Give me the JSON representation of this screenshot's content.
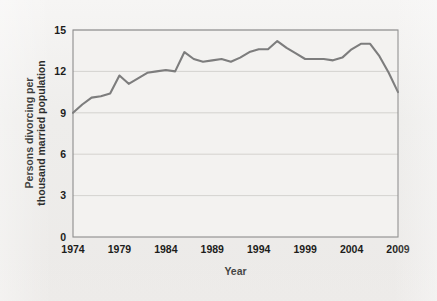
{
  "figure": {
    "background_color": "#efeeec",
    "plot_background_color": "#f2f1ef",
    "frame_color": "#8c8c8c",
    "grid_color": "#c9c8c5",
    "line_color": "#7d7d7d",
    "text_color": "#1d1d1b"
  },
  "chart_data": {
    "type": "line",
    "title": "",
    "subtitle": "",
    "xlabel": "Year",
    "ylabel": "Persons divorcing per thousand married population",
    "ylabel_line1": "Persons divorcing per",
    "ylabel_line2": "thousand married population",
    "xlim": [
      1974,
      2009
    ],
    "ylim": [
      0,
      15
    ],
    "xticks": [
      1974,
      1979,
      1984,
      1989,
      1994,
      1999,
      2004,
      2009
    ],
    "xtick_labels": [
      "1974",
      "1979",
      "1984",
      "1989",
      "1994",
      "1999",
      "2004",
      "2009"
    ],
    "yticks": [
      0,
      3,
      6,
      9,
      12,
      15
    ],
    "ytick_labels": [
      "0",
      "3",
      "6",
      "9",
      "12",
      "15"
    ],
    "grid": "horizontal",
    "legend": "none",
    "series": [
      {
        "name": "Persons divorcing per thousand married population",
        "x": [
          1974,
          1975,
          1976,
          1977,
          1978,
          1979,
          1980,
          1981,
          1982,
          1983,
          1984,
          1985,
          1986,
          1987,
          1988,
          1989,
          1990,
          1991,
          1992,
          1993,
          1994,
          1995,
          1996,
          1997,
          1998,
          1999,
          2000,
          2001,
          2002,
          2003,
          2004,
          2005,
          2006,
          2007,
          2008,
          2009
        ],
        "values": [
          9.0,
          9.6,
          10.1,
          10.2,
          10.4,
          11.7,
          11.1,
          11.5,
          11.9,
          12.0,
          12.1,
          12.0,
          13.4,
          12.9,
          12.7,
          12.8,
          12.9,
          12.7,
          13.0,
          13.4,
          13.6,
          13.6,
          14.2,
          13.7,
          13.3,
          12.9,
          12.9,
          12.9,
          12.8,
          13.0,
          13.6,
          14.0,
          14.0,
          13.1,
          11.9,
          10.5
        ]
      }
    ]
  }
}
